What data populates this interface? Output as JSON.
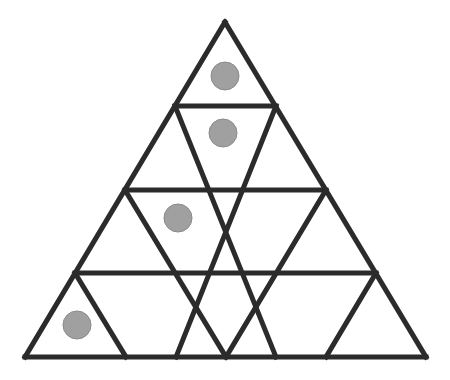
{
  "figure": {
    "background_color": "#ffffff",
    "canvas": {
      "width": 450,
      "height": 380
    }
  },
  "chart_data": {
    "type": "diagram",
    "subtitle": "",
    "xlabel": "",
    "ylabel": "",
    "grid": false,
    "legend_position": "none",
    "annotations": [],
    "geometry": {
      "shape": "equilateral-triangle",
      "rows": 4,
      "apex": {
        "x": 225,
        "y": 22
      },
      "base_left": {
        "x": 25,
        "y": 357
      },
      "base_right": {
        "x": 426,
        "y": 357
      },
      "row_height": 83.75,
      "small_triangle_count": 16,
      "upward_triangles": 10,
      "downward_triangles": 6,
      "line_color": "#2b2b2b",
      "line_width": 5,
      "line_join": "miter"
    },
    "row_divider_y": [
      106,
      190,
      273,
      357
    ],
    "row_triangle_counts": [
      1,
      3,
      5,
      7
    ],
    "circles": {
      "count": 4,
      "radius": 14,
      "fill": "#a0a0a0",
      "stroke": "#8a8a8a",
      "stroke_width": 1,
      "items": [
        {
          "label": "counter-row-1",
          "row": 1,
          "cx": 225,
          "cy": 76
        },
        {
          "label": "counter-row-2",
          "row": 2,
          "cx": 223,
          "cy": 133
        },
        {
          "label": "counter-row-3",
          "row": 3,
          "cx": 178,
          "cy": 218
        },
        {
          "label": "counter-row-4",
          "row": 4,
          "cx": 77,
          "cy": 325
        }
      ]
    },
    "edges": {
      "outline": [
        {
          "name": "left-edge",
          "x1": 225,
          "y1": 22,
          "x2": 25,
          "y2": 357
        },
        {
          "name": "right-edge",
          "x1": 225,
          "y1": 22,
          "x2": 426,
          "y2": 357
        },
        {
          "name": "base-edge",
          "x1": 25,
          "y1": 357,
          "x2": 426,
          "y2": 357
        }
      ],
      "horizontal": [
        {
          "name": "row-1-2-divider",
          "x1": 175,
          "y1": 106,
          "x2": 276,
          "y2": 106
        },
        {
          "name": "row-2-3-divider",
          "x1": 125,
          "y1": 190,
          "x2": 326,
          "y2": 190
        },
        {
          "name": "row-3-4-divider",
          "x1": 75,
          "y1": 273,
          "x2": 376,
          "y2": 273
        }
      ],
      "left_leaning": [
        {
          "name": "left-lean-1",
          "x1": 276,
          "y1": 106,
          "x2": 176,
          "y2": 357
        },
        {
          "name": "left-lean-2",
          "x1": 326,
          "y1": 190,
          "x2": 226,
          "y2": 357
        },
        {
          "name": "left-lean-3",
          "x1": 376,
          "y1": 273,
          "x2": 326,
          "y2": 357
        }
      ],
      "right_leaning": [
        {
          "name": "right-lean-1",
          "x1": 175,
          "y1": 106,
          "x2": 276,
          "y2": 357
        },
        {
          "name": "right-lean-2",
          "x1": 125,
          "y1": 190,
          "x2": 226,
          "y2": 357
        },
        {
          "name": "right-lean-3",
          "x1": 75,
          "y1": 273,
          "x2": 126,
          "y2": 357
        }
      ]
    }
  }
}
